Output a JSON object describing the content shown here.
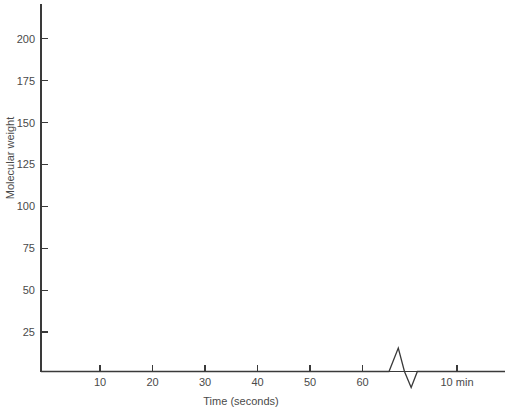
{
  "chart_data": {
    "type": "line",
    "title": "",
    "xlabel": "Time (seconds)",
    "ylabel": "Molecular weight",
    "grid": false,
    "legend": "none",
    "xlim": [
      0,
      90
    ],
    "ylim": [
      0,
      220
    ],
    "yticks": [
      25,
      50,
      75,
      100,
      125,
      150,
      175,
      200
    ],
    "ytick_labels": [
      "25",
      "50",
      "75",
      "100",
      "125",
      "150",
      "175",
      "200"
    ],
    "xticks": [
      10,
      20,
      30,
      40,
      50,
      60,
      80
    ],
    "xtick_labels": [
      "10",
      "20",
      "30",
      "40",
      "50",
      "60",
      "10 min"
    ],
    "series": [
      {
        "name": "trace",
        "x": [
          0,
          67.5,
          69.3,
          70.5,
          71.8,
          73.0,
          90.0
        ],
        "y": [
          0,
          0,
          14.0,
          0,
          -9.5,
          0,
          0
        ]
      }
    ],
    "annotations": [
      "Flat baseline at zero molecular weight across the full time axis",
      "Single sharp bipolar spike just after 60 seconds: upward deflection to about 14 followed immediately by a downward deflection to about -9.5, then return to baseline"
    ],
    "line_color": "#3a3a3a",
    "background_color": "#ffffff"
  },
  "axes": {
    "y_axis_name": "Molecular weight",
    "x_axis_name": "Time (seconds)"
  }
}
